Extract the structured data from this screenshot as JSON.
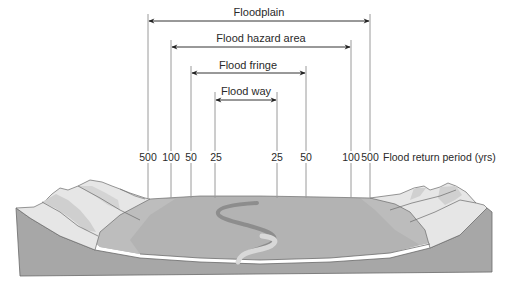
{
  "diagram": {
    "zones": [
      {
        "id": "floodplain",
        "label": "Floodplain",
        "left_period": "500",
        "right_period": "500"
      },
      {
        "id": "flood-hazard-area",
        "label": "Flood hazard area",
        "left_period": "100",
        "right_period": "100"
      },
      {
        "id": "flood-fringe",
        "label": "Flood fringe",
        "left_period": "50",
        "right_period": "50"
      },
      {
        "id": "flood-way",
        "label": "Flood way",
        "left_period": "25",
        "right_period": "25"
      }
    ],
    "return_periods": {
      "axis_title": "Flood return period (yrs)",
      "ticks": [
        "500",
        "100",
        "50",
        "25",
        "25",
        "50",
        "100",
        "500"
      ]
    },
    "colors": {
      "line": "#9a9a9a",
      "arrow": "#222222",
      "text": "#2a2a2a",
      "terrain_front": "#a8a8a8",
      "terrain_floor": "#b4b4b4",
      "terrain_slope": "#c2c2c2",
      "hills_light": "#e8e8e8",
      "hills_mid": "#d2d2d2",
      "river_dark": "#8e8e8e",
      "river_light": "#d6d6d6"
    }
  }
}
